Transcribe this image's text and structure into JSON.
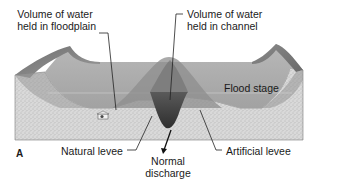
{
  "figure": {
    "panel_letter": "A",
    "labels": {
      "floodplain_volume": {
        "line1": "Volume of water",
        "line2": "held in floodplain"
      },
      "channel_volume": {
        "line1": "Volume of water",
        "line2": "held in channel"
      },
      "flood_stage": "Flood stage",
      "natural_levee": "Natural levee",
      "normal_discharge": {
        "line1": "Normal",
        "line2": "discharge"
      },
      "artificial_levee": "Artificial levee"
    },
    "colors": {
      "background": "#ffffff",
      "sediment": "#cfcfcf",
      "floodplain_water": "#a9a9a9",
      "channel_water": "#4a4a4a",
      "levee_top": "#8a8a8a",
      "text": "#1a1a1a"
    }
  }
}
